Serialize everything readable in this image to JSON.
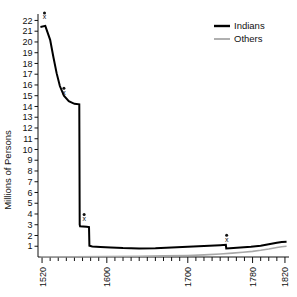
{
  "chart_data": {
    "type": "line",
    "title": "",
    "xlabel": "",
    "ylabel": "Millions of Persons",
    "xlim": [
      1515,
      1825
    ],
    "ylim": [
      0,
      22.6
    ],
    "grid": false,
    "legend_position": "top-right",
    "y_ticks": [
      1,
      2,
      3,
      4,
      5,
      6,
      7,
      8,
      9,
      10,
      11,
      12,
      13,
      14,
      15,
      16,
      17,
      18,
      19,
      20,
      21,
      22
    ],
    "x_tick_labels": [
      "1520",
      "1600",
      "1700",
      "1780",
      "1820"
    ],
    "x_tick_label_values": [
      1520,
      1600,
      1700,
      1780,
      1820
    ],
    "x_minor_tick_step": 10,
    "series": [
      {
        "name": "Indians",
        "color": "#000000",
        "width": 2.0,
        "points": [
          [
            1518,
            21.4
          ],
          [
            1524,
            21.5
          ],
          [
            1530,
            20.2
          ],
          [
            1534,
            18.6
          ],
          [
            1538,
            17.1
          ],
          [
            1542,
            15.9
          ],
          [
            1547,
            15.0
          ],
          [
            1553,
            14.5
          ],
          [
            1560,
            14.25
          ],
          [
            1566,
            14.2
          ],
          [
            1566.5,
            3.0
          ],
          [
            1567,
            2.85
          ],
          [
            1575,
            2.82
          ],
          [
            1578,
            2.78
          ],
          [
            1578.5,
            1.05
          ],
          [
            1582,
            0.98
          ],
          [
            1592,
            0.93
          ],
          [
            1605,
            0.88
          ],
          [
            1620,
            0.83
          ],
          [
            1640,
            0.8
          ],
          [
            1660,
            0.82
          ],
          [
            1680,
            0.88
          ],
          [
            1700,
            0.95
          ],
          [
            1720,
            1.02
          ],
          [
            1740,
            1.1
          ],
          [
            1747,
            1.13
          ],
          [
            1747.5,
            0.8
          ],
          [
            1752,
            0.82
          ],
          [
            1765,
            0.88
          ],
          [
            1778,
            0.95
          ],
          [
            1790,
            1.05
          ],
          [
            1800,
            1.18
          ],
          [
            1810,
            1.32
          ],
          [
            1816,
            1.4
          ],
          [
            1822,
            1.42
          ]
        ]
      },
      {
        "name": "Others",
        "color": "#a8a8a8",
        "width": 1.6,
        "points": [
          [
            1518,
            0.02
          ],
          [
            1560,
            0.03
          ],
          [
            1600,
            0.05
          ],
          [
            1640,
            0.07
          ],
          [
            1670,
            0.1
          ],
          [
            1700,
            0.14
          ],
          [
            1720,
            0.2
          ],
          [
            1740,
            0.28
          ],
          [
            1755,
            0.36
          ],
          [
            1768,
            0.44
          ],
          [
            1780,
            0.52
          ],
          [
            1790,
            0.62
          ],
          [
            1800,
            0.74
          ],
          [
            1810,
            0.88
          ],
          [
            1816,
            0.96
          ],
          [
            1822,
            1.0
          ]
        ]
      }
    ],
    "markers": [
      {
        "label": "x",
        "x": 1523,
        "y": 22.1
      },
      {
        "label": "x",
        "x": 1547,
        "y": 15.1
      },
      {
        "label": "x",
        "x": 1572,
        "y": 3.35
      },
      {
        "label": "x",
        "x": 1748,
        "y": 1.42
      }
    ],
    "legend": [
      {
        "label": "Indians",
        "color": "#000000",
        "width": 2.4
      },
      {
        "label": "Others",
        "color": "#a8a8a8",
        "width": 1.8
      }
    ]
  }
}
